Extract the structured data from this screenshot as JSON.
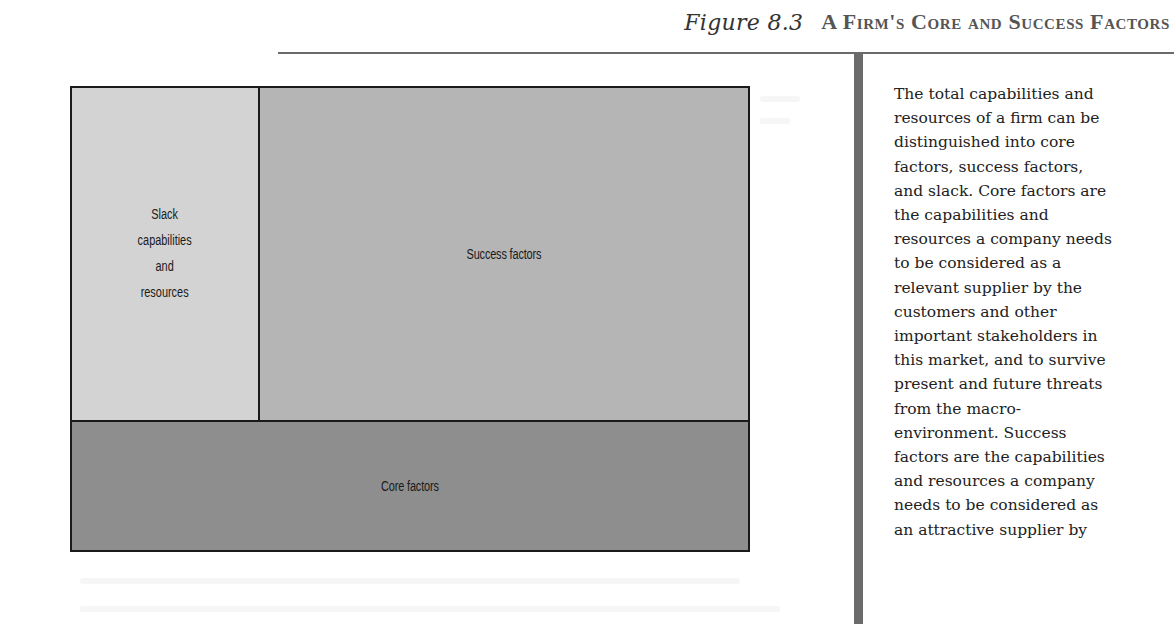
{
  "figure": {
    "label": "Figure 8.3",
    "title": "A Firm's Core and Success Factors"
  },
  "diagram": {
    "regions": [
      {
        "id": "slack",
        "lines": [
          "Slack",
          "capabilities",
          "and",
          "resources"
        ],
        "fill": "#d3d3d3"
      },
      {
        "id": "success",
        "label": "Success factors",
        "fill": "#b5b5b5"
      },
      {
        "id": "core",
        "label": "Core factors",
        "fill": "#8e8e8e"
      }
    ],
    "border_color": "#1a1a1a"
  },
  "caption": {
    "lines": [
      "The total capabilities and",
      "resources of a firm can be",
      "distinguished into core",
      "factors, success factors,",
      "and slack. Core factors are",
      "the capabilities and",
      "resources a company needs",
      "to be considered as a",
      "relevant supplier by the",
      "customers and other",
      "important stakeholders in",
      "this market, and to survive",
      "present and future threats",
      "from the macro-",
      "environment. Success",
      "factors are the capabilities",
      "and resources a company",
      "needs to be considered as",
      "an attractive supplier by"
    ]
  },
  "colors": {
    "rule": "#6a6a6a",
    "sidebar": "#6b6b6b",
    "title_text": "#555555"
  }
}
